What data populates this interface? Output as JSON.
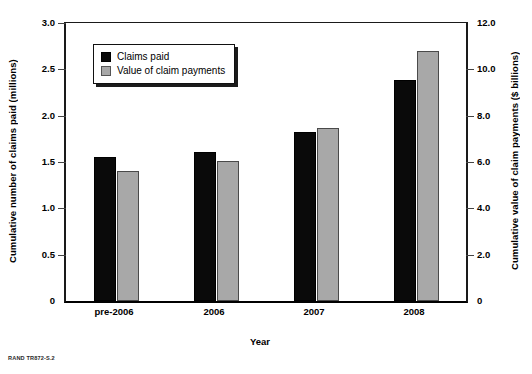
{
  "source_caption": "RAND TR872-S.2",
  "legend": {
    "position": "top-left-inside",
    "entries": [
      {
        "label": "Claims paid",
        "color": "#0a0a0a",
        "swatch": "black-square-swatch"
      },
      {
        "label": "Value of claim payments",
        "color": "#a8a8a8",
        "swatch": "gray-square-swatch"
      }
    ]
  },
  "chart_data": {
    "type": "bar",
    "title": "",
    "subtitle": "",
    "xlabel": "Year",
    "ylabel": "Cumulative number of claims paid (millions)",
    "y2label": "Cumulative value of claim payments ($ billions)",
    "categories": [
      "pre-2006",
      "2006",
      "2007",
      "2008"
    ],
    "series": [
      {
        "name": "Claims paid",
        "axis": "left",
        "unit": "millions",
        "color": "#0a0a0a",
        "values": [
          1.55,
          1.61,
          1.82,
          2.39
        ]
      },
      {
        "name": "Value of claim payments",
        "axis": "right",
        "unit": "$ billions",
        "color": "#a8a8a8",
        "values": [
          5.6,
          6.05,
          7.45,
          10.8
        ]
      }
    ],
    "ylim": [
      0,
      3.0
    ],
    "y2lim": [
      0,
      12.0
    ],
    "yticks": [
      "0",
      "0.5",
      "1.0",
      "1.5",
      "2.0",
      "2.5",
      "3.0"
    ],
    "ytick_values": [
      0,
      0.5,
      1.0,
      1.5,
      2.0,
      2.5,
      3.0
    ],
    "y2ticks": [
      "0",
      "2.0",
      "4.0",
      "6.0",
      "8.0",
      "10.0",
      "12.0"
    ],
    "y2tick_values": [
      0,
      2.0,
      4.0,
      6.0,
      8.0,
      10.0,
      12.0
    ],
    "grid": false,
    "legend_position": "upper left (inside plot)"
  }
}
